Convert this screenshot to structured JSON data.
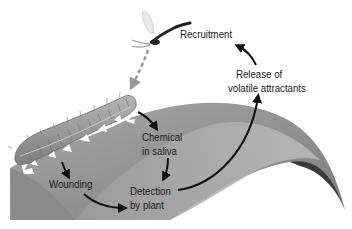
{
  "diagram": {
    "type": "process-cycle",
    "labels": {
      "recruitment": "Recruitment",
      "release_line1": "Release of",
      "release_line2": "volatile attractants",
      "chemical_line1": "Chemical",
      "chemical_line2": "in saliva",
      "wounding": "Wounding",
      "detection_line1": "Detection",
      "detection_line2": "by plant"
    },
    "nodes": [
      {
        "id": "caterpillar",
        "kind": "illustration"
      },
      {
        "id": "wounding",
        "label": "Wounding"
      },
      {
        "id": "chemical",
        "label": "Chemical in saliva"
      },
      {
        "id": "detection",
        "label": "Detection by plant"
      },
      {
        "id": "release",
        "label": "Release of volatile attractants"
      },
      {
        "id": "recruitment",
        "label": "Recruitment"
      },
      {
        "id": "wasp",
        "kind": "illustration"
      }
    ],
    "edges": [
      {
        "from": "caterpillar",
        "to": "wounding",
        "style": "solid"
      },
      {
        "from": "caterpillar",
        "to": "chemical",
        "style": "solid"
      },
      {
        "from": "wounding",
        "to": "detection",
        "style": "solid"
      },
      {
        "from": "chemical",
        "to": "detection",
        "style": "solid"
      },
      {
        "from": "detection",
        "to": "release",
        "style": "solid"
      },
      {
        "from": "release",
        "to": "recruitment",
        "style": "solid"
      },
      {
        "from": "wasp",
        "to": "caterpillar",
        "style": "dashed"
      }
    ],
    "colors": {
      "leaf_light": "#b4b4b4",
      "leaf_mid": "#8c8c8c",
      "leaf_dark": "#3c3c3c",
      "caterpillar": "#9a9a9a",
      "arrow": "#111111",
      "dashed_arrow": "#9a9a9a",
      "text": "#1a1a1a"
    }
  }
}
